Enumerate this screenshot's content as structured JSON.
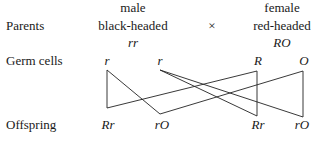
{
  "row_labels": {
    "parents": "Parents",
    "germ_cells": "Germ cells",
    "offspring": "Offspring"
  },
  "male": {
    "sex": "male",
    "phenotype": "black-headed",
    "genotype": "rr"
  },
  "cross_symbol": "×",
  "female": {
    "sex": "female",
    "phenotype": "red-headed",
    "genotype": "RO"
  },
  "germ_cells": [
    "r",
    "r",
    "R",
    "O"
  ],
  "offspring": [
    "Rr",
    "rO",
    "Rr",
    "rO"
  ],
  "connections": [
    {
      "from": "r (1st)",
      "to": "Rr (1st)"
    },
    {
      "from": "r (1st)",
      "to": "rO (2nd)"
    },
    {
      "from": "r (2nd)",
      "to": "Rr (3rd)"
    },
    {
      "from": "r (2nd)",
      "to": "rO (4th)"
    },
    {
      "from": "R",
      "to": "Rr (1st)"
    },
    {
      "from": "R",
      "to": "Rr (3rd)"
    },
    {
      "from": "O",
      "to": "rO (2nd)"
    },
    {
      "from": "O",
      "to": "rO (4th)"
    }
  ]
}
